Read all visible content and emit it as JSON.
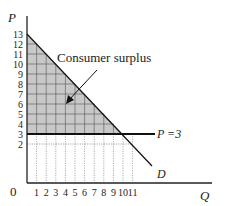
{
  "chart_data": {
    "type": "line",
    "title": "",
    "xlabel": "Q",
    "ylabel": "P",
    "origin_label": "0",
    "x_ticks": [
      "1",
      "2",
      "3",
      "4",
      "5",
      "6",
      "7",
      "8",
      "9",
      "10",
      "11"
    ],
    "y_ticks": [
      "2",
      "3",
      "4",
      "5",
      "6",
      "7",
      "8",
      "9",
      "10",
      "11",
      "12",
      "13"
    ],
    "xlim": [
      0,
      13
    ],
    "ylim": [
      0,
      13
    ],
    "grid": true,
    "series": [
      {
        "name": "D",
        "kind": "demand",
        "points": [
          [
            0,
            13
          ],
          [
            10,
            3
          ],
          [
            12.5,
            0.5
          ]
        ],
        "equation": "P = 13 - Q"
      },
      {
        "name": "P=3",
        "kind": "price-line",
        "points": [
          [
            0,
            3
          ],
          [
            13,
            3
          ]
        ]
      }
    ],
    "shaded_region": {
      "label": "Consumer surplus",
      "vertices": [
        [
          0,
          13
        ],
        [
          0,
          3
        ],
        [
          10,
          3
        ]
      ],
      "color": "#c8c8c8"
    },
    "annotations": [
      {
        "text": "Consumer surplus",
        "arrow_to": [
          4,
          7
        ]
      },
      {
        "text": "P =3",
        "at": "end of price line"
      },
      {
        "text": "D",
        "at": "end of demand curve"
      }
    ]
  },
  "labels": {
    "p_axis": "P",
    "q_axis": "Q",
    "origin": "0",
    "demand": "D",
    "price_line": "P =3",
    "surplus": "Consumer surplus"
  }
}
